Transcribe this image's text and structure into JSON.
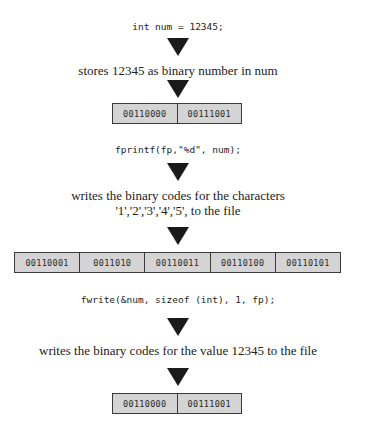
{
  "steps": [
    {
      "code": "int num = 12345;",
      "description": [
        "stores 12345 as binary number in num"
      ],
      "memory": [
        "00110000",
        "00111001"
      ]
    },
    {
      "code": "fprintf(fp,\"%d\", num);",
      "description": [
        "writes the binary codes for the characters",
        "'1','2','3','4','5', to the file"
      ],
      "memory": [
        "00110001",
        "0011010",
        "00110011",
        "00110100",
        "00110101"
      ]
    },
    {
      "code": "fwrite(&num, sizeof (int), 1, fp);",
      "description": [
        "writes the binary codes for the value 12345 to the file"
      ],
      "memory": [
        "00110000",
        "00111001"
      ]
    }
  ],
  "colors": {
    "arrow": "#1a1a1a",
    "cell_fill": "#d4d4d4",
    "cell_border": "#3a3a3a",
    "text": "#222222"
  }
}
